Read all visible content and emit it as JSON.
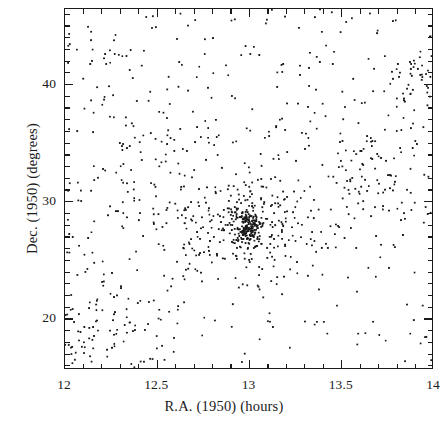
{
  "figure": {
    "name": "galaxy-sky-distribution"
  },
  "chart_data": {
    "type": "scatter",
    "title": "",
    "xlabel": "R.A. (1950) (hours)",
    "ylabel": "Dec. (1950) (degrees)",
    "xlim": [
      12,
      14
    ],
    "ylim": [
      15.65,
      46.45
    ],
    "x_invert": false,
    "grid": false,
    "legend": null,
    "xticks": [
      12,
      12.5,
      13,
      13.5,
      14
    ],
    "xtick_labels": [
      "12",
      "12.5",
      "13",
      "13.5",
      "14"
    ],
    "x_minor_step": 0.1,
    "yticks": [
      20,
      30,
      40
    ],
    "ytick_labels": [
      "20",
      "30",
      "40"
    ],
    "y_minor_step": 1,
    "tick_direction": "in",
    "frame": "all-four-sides",
    "marker": "point",
    "marker_size_px": 1.8,
    "marker_color": "#1a1a1a",
    "n_points": 1180,
    "density_structures": [
      {
        "name": "Coma cluster core",
        "x": 13.0,
        "y": 27.9,
        "n": 130,
        "sigma_x": 0.032,
        "sigma_y": 0.62
      },
      {
        "name": "Coma cluster halo",
        "x": 12.99,
        "y": 28.0,
        "n": 110,
        "sigma_x": 0.085,
        "sigma_y": 1.7
      },
      {
        "name": "Coma outer envelope",
        "x": 12.98,
        "y": 28.1,
        "n": 90,
        "sigma_x": 0.18,
        "sigma_y": 3.2
      },
      {
        "name": "west filament",
        "x": 12.72,
        "y": 28.3,
        "n": 55,
        "sigma_x": 0.16,
        "sigma_y": 1.9
      },
      {
        "name": "east filament",
        "x": 13.28,
        "y": 29.2,
        "n": 55,
        "sigma_x": 0.17,
        "sigma_y": 2.1
      },
      {
        "name": "A1367 group",
        "x": 11.75,
        "y": 19.8,
        "n": 95,
        "sigma_x": 0.22,
        "sigma_y": 2.6
      },
      {
        "name": "southwest excess",
        "x": 12.18,
        "y": 18.3,
        "n": 70,
        "sigma_x": 0.2,
        "sigma_y": 2.2
      },
      {
        "name": "north clump",
        "x": 13.87,
        "y": 40.9,
        "n": 45,
        "sigma_x": 0.1,
        "sigma_y": 1.6
      },
      {
        "name": "northwest band",
        "x": 12.62,
        "y": 35.4,
        "n": 40,
        "sigma_x": 0.22,
        "sigma_y": 2.4
      },
      {
        "name": "east band",
        "x": 13.62,
        "y": 31.6,
        "n": 38,
        "sigma_x": 0.18,
        "sigma_y": 2.2
      },
      {
        "name": "northeast group",
        "x": 13.78,
        "y": 33.3,
        "n": 34,
        "sigma_x": 0.12,
        "sigma_y": 1.8
      }
    ],
    "background_points": 418,
    "random_seed": 20250611
  },
  "axes": {
    "x_title": "R.A. (1950) (hours)",
    "y_title": "Dec. (1950) (degrees)",
    "x_tick_labels": [
      "12",
      "12.5",
      "13",
      "13.5",
      "14"
    ],
    "y_tick_labels": [
      "40",
      "30",
      "20"
    ]
  }
}
